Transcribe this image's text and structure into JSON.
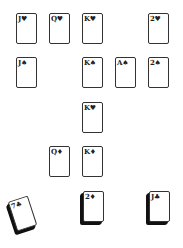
{
  "board": {
    "cards": [
      {
        "label": "J♥",
        "x": 16,
        "y": 13
      },
      {
        "label": "Q♥",
        "x": 49,
        "y": 13
      },
      {
        "label": "K♥",
        "x": 82,
        "y": 13
      },
      {
        "label": "2♥",
        "x": 148,
        "y": 13
      },
      {
        "label": "J♠",
        "x": 16,
        "y": 57
      },
      {
        "label": "K♠",
        "x": 82,
        "y": 57
      },
      {
        "label": "A♠",
        "x": 115,
        "y": 57
      },
      {
        "label": "2♠",
        "x": 148,
        "y": 57
      },
      {
        "label": "K♥",
        "x": 82,
        "y": 102
      },
      {
        "label": "Q♦",
        "x": 49,
        "y": 146
      },
      {
        "label": "K♦",
        "x": 82,
        "y": 146
      }
    ],
    "stacks": [
      {
        "label": "7♣",
        "x": 12,
        "y": 198
      },
      {
        "label": "2♦",
        "x": 83,
        "y": 191
      },
      {
        "label": "J♣",
        "x": 149,
        "y": 191
      }
    ]
  }
}
